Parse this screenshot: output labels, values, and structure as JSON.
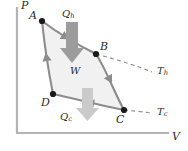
{
  "figure": {
    "type": "pv-diagram-carnot-cycle",
    "axes": {
      "y_label": "P",
      "x_label": "V",
      "origin": [
        17,
        133
      ],
      "y_top": [
        17,
        8
      ],
      "x_right": [
        168,
        133
      ],
      "axis_color": "#b0b0b0"
    },
    "cycle": {
      "fill_color": "#f0f0f0",
      "stroke_color": "#8a8a8a",
      "points": [
        {
          "id": "A",
          "label": "A",
          "x": 42,
          "y": 21,
          "label_x": 29,
          "label_y": 11
        },
        {
          "id": "B",
          "label": "B",
          "x": 96,
          "y": 54,
          "label_x": 100,
          "label_y": 42
        },
        {
          "id": "C",
          "label": "C",
          "x": 124,
          "y": 110,
          "label_x": 116,
          "label_y": 116
        },
        {
          "id": "D",
          "label": "D",
          "x": 53,
          "y": 94,
          "label_x": 41,
          "label_y": 99
        }
      ]
    },
    "annotations": {
      "heat_in": {
        "label_main": "Q",
        "label_sub": "h",
        "label_x": 62,
        "label_y": 13,
        "arrow_color": "#9a9a9a",
        "arrow_direction": "down"
      },
      "heat_out": {
        "label_main": "Q",
        "label_sub": "c",
        "label_x": 62,
        "label_y": 115,
        "arrow_color": "#c9c9c9",
        "arrow_direction": "down"
      },
      "work": {
        "label": "W",
        "label_x": 70,
        "label_y": 67
      },
      "isotherm_hot": {
        "label_main": "T",
        "label_sub": "h",
        "label_x": 157,
        "label_y": 68,
        "dash_color": "#8a8a8a"
      },
      "isotherm_cold": {
        "label_main": "T",
        "label_sub": "c",
        "label_x": 157,
        "label_y": 109,
        "dash_color": "#8a8a8a"
      }
    }
  }
}
